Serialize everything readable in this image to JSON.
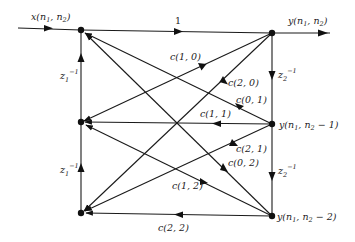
{
  "diagram": {
    "type": "signal-flow-graph",
    "input_label": "x(n1, n2)",
    "output_label": "y(n1, n2)",
    "forward_gain": "1",
    "left_nodes": [
      {
        "id": "L0",
        "x": 81,
        "y": 30
      },
      {
        "id": "L1",
        "x": 81,
        "y": 122
      },
      {
        "id": "L2",
        "x": 81,
        "y": 213
      }
    ],
    "right_nodes": [
      {
        "id": "R0",
        "x": 272,
        "y": 33,
        "label": "y(n1, n2)"
      },
      {
        "id": "R1",
        "x": 272,
        "y": 124,
        "label": "y(n1, n2 − 1)"
      },
      {
        "id": "R2",
        "x": 272,
        "y": 216,
        "label": "y(n1, n2 − 2)"
      }
    ],
    "delays": {
      "left": "z1^-1",
      "right": "z2^-1"
    },
    "coefficients": [
      {
        "label": "c(1, 0)",
        "from": "R0",
        "to": "L1"
      },
      {
        "label": "c(2, 0)",
        "from": "R0",
        "to": "L2"
      },
      {
        "label": "c(0, 1)",
        "from": "R1",
        "to": "L0"
      },
      {
        "label": "c(1, 1)",
        "from": "R1",
        "to": "L1"
      },
      {
        "label": "c(2, 1)",
        "from": "R1",
        "to": "L2"
      },
      {
        "label": "c(0, 2)",
        "from": "R2",
        "to": "L0"
      },
      {
        "label": "c(1, 2)",
        "from": "R2",
        "to": "L1"
      },
      {
        "label": "c(2, 2)",
        "from": "R2",
        "to": "L2"
      }
    ]
  }
}
